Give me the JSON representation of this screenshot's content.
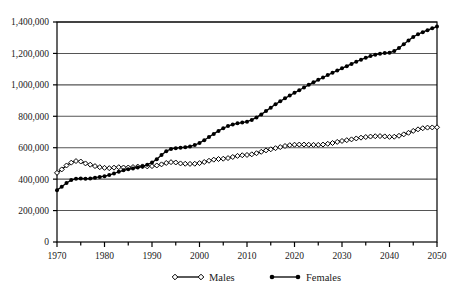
{
  "chart_data": {
    "type": "line",
    "title": "",
    "subtitle": "",
    "xlabel": "",
    "ylabel": "",
    "xlim": [
      1970,
      2050
    ],
    "ylim": [
      0,
      1400000
    ],
    "xticks": [
      1970,
      1980,
      1990,
      2000,
      2010,
      2020,
      2030,
      2040,
      2050
    ],
    "xticklabels": [
      "1970",
      "1980",
      "1990",
      "2000",
      "2010",
      "2020",
      "2030",
      "2040",
      "2050"
    ],
    "yticks": [
      0,
      200000,
      400000,
      600000,
      800000,
      1000000,
      1200000,
      1400000
    ],
    "yticklabels": [
      "0",
      "200,000",
      "400,000",
      "600,000",
      "800,000",
      "1,000,000",
      "1,200,000",
      "1,400,000"
    ],
    "grid": "horizontal",
    "legend_position": "bottom",
    "marker_every": 1,
    "x": [
      1970,
      1971,
      1972,
      1973,
      1974,
      1975,
      1976,
      1977,
      1978,
      1979,
      1980,
      1981,
      1982,
      1983,
      1984,
      1985,
      1986,
      1987,
      1988,
      1989,
      1990,
      1991,
      1992,
      1993,
      1994,
      1995,
      1996,
      1997,
      1998,
      1999,
      2000,
      2001,
      2002,
      2003,
      2004,
      2005,
      2006,
      2007,
      2008,
      2009,
      2010,
      2011,
      2012,
      2013,
      2014,
      2015,
      2016,
      2017,
      2018,
      2019,
      2020,
      2021,
      2022,
      2023,
      2024,
      2025,
      2026,
      2027,
      2028,
      2029,
      2030,
      2031,
      2032,
      2033,
      2034,
      2035,
      2036,
      2037,
      2038,
      2039,
      2040,
      2041,
      2042,
      2043,
      2044,
      2045,
      2046,
      2047,
      2048,
      2049,
      2050
    ],
    "series": [
      {
        "name": "Males",
        "marker": "open-diamond",
        "color": "#000000",
        "values": [
          440000,
          462000,
          487000,
          505000,
          515000,
          512000,
          500000,
          492000,
          483000,
          476000,
          472000,
          470000,
          473000,
          476000,
          474000,
          474000,
          477000,
          480000,
          481000,
          481000,
          483000,
          487000,
          494000,
          503000,
          508000,
          506000,
          500000,
          498000,
          497000,
          498000,
          502000,
          509000,
          517000,
          524000,
          528000,
          530000,
          534000,
          541000,
          548000,
          552000,
          554000,
          558000,
          565000,
          574000,
          583000,
          590000,
          597000,
          604000,
          611000,
          616000,
          619000,
          620000,
          620000,
          619000,
          618000,
          618000,
          620000,
          625000,
          630000,
          637000,
          643000,
          648000,
          653000,
          659000,
          664000,
          668000,
          671000,
          673000,
          674000,
          672000,
          669000,
          670000,
          676000,
          685000,
          695000,
          707000,
          717000,
          724000,
          728000,
          729000,
          730000
        ]
      },
      {
        "name": "Females",
        "marker": "filled-circle",
        "color": "#000000",
        "values": [
          330000,
          352000,
          375000,
          394000,
          403000,
          404000,
          403000,
          404000,
          409000,
          414000,
          419000,
          426000,
          436000,
          447000,
          456000,
          463000,
          468000,
          474000,
          482000,
          492000,
          506000,
          527000,
          554000,
          578000,
          592000,
          597000,
          600000,
          603000,
          608000,
          617000,
          630000,
          648000,
          668000,
          688000,
          707000,
          724000,
          738000,
          748000,
          755000,
          760000,
          766000,
          777000,
          793000,
          812000,
          833000,
          855000,
          876000,
          896000,
          914000,
          932000,
          949000,
          966000,
          983000,
          1000000,
          1016000,
          1032000,
          1047000,
          1062000,
          1077000,
          1091000,
          1105000,
          1119000,
          1133000,
          1147000,
          1160000,
          1172000,
          1183000,
          1192000,
          1198000,
          1202000,
          1205000,
          1215000,
          1234000,
          1258000,
          1283000,
          1305000,
          1322000,
          1335000,
          1348000,
          1360000,
          1372000
        ]
      }
    ]
  },
  "legend": {
    "items": [
      {
        "label": "Males",
        "marker": "open-diamond"
      },
      {
        "label": "Females",
        "marker": "filled-circle"
      }
    ]
  }
}
